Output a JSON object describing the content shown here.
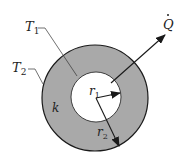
{
  "diagram": {
    "title": "",
    "colors": {
      "background": "#ffffff",
      "wall_fill": "#a9a9a9",
      "inner_fill": "#ffffff",
      "stroke": "#1a1a1a"
    },
    "labels": {
      "inner_temperature": "T1",
      "inner_temperature_base": "T",
      "inner_temperature_sub": "1",
      "outer_temperature": "T2",
      "outer_temperature_base": "T",
      "outer_temperature_sub": "2",
      "conductivity": "k",
      "inner_radius": "r1",
      "inner_radius_base": "r",
      "inner_radius_sub": "1",
      "outer_radius": "r2",
      "outer_radius_base": "r",
      "outer_radius_sub": "2",
      "heat_rate": "Q̇",
      "heat_rate_base": "Q",
      "heat_rate_dot": "·"
    }
  }
}
